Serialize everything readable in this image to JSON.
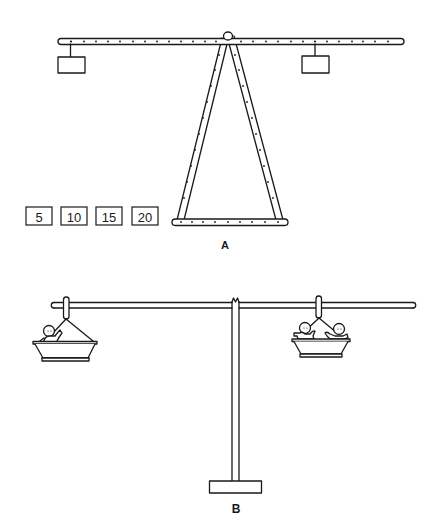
{
  "figure_a": {
    "label": "A",
    "description": "Balance beam with holes on an A-frame stand, two hanging weight boxes",
    "weights": [
      {
        "value": "5"
      },
      {
        "value": "10"
      },
      {
        "value": "15"
      },
      {
        "value": "20"
      }
    ]
  },
  "figure_b": {
    "label": "B",
    "description": "Balance on a T-stand with a basket on each end; one figure in left basket, two figures in right basket"
  },
  "colors": {
    "ink": "#1a1a1a",
    "background": "#ffffff"
  }
}
